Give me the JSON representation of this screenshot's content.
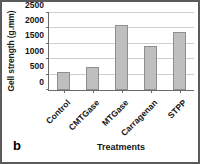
{
  "figure": {
    "panel_label": "b",
    "frame_color": "#5b5b5b",
    "background": "#ffffff"
  },
  "chart_data": {
    "type": "bar",
    "title": "",
    "subtitle": "",
    "xlabel": "Treatments",
    "ylabel": "Gell strength (g.mm)",
    "categories": [
      "Control",
      "CMTGase",
      "MTGase",
      "Carragenan",
      "STPP"
    ],
    "values": [
      590,
      740,
      2120,
      1430,
      1890
    ],
    "ylim": [
      0,
      2500
    ],
    "ytick_labels": [
      "0",
      "500",
      "1000",
      "1500",
      "2000",
      "2500"
    ],
    "ytick_values": [
      0,
      500,
      1000,
      1500,
      2000,
      2500
    ],
    "grid": true,
    "legend": "none",
    "bar_color": "#bfbfbf",
    "bar_edge_color": "#8f8f8f",
    "grid_color": "#cfcfcf",
    "axis_color": "#6a6a6a",
    "xtick_rotation": -45
  }
}
